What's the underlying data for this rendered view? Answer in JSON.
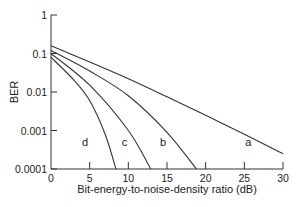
{
  "chart_data": {
    "type": "line",
    "title": "",
    "xlabel": "Bit-energy-to-noise-density ratio (dB)",
    "ylabel": "BER",
    "xlim": [
      0,
      30
    ],
    "ylim": [
      0.0001,
      1
    ],
    "yscale": "log",
    "grid": false,
    "legend": "inline curve labels",
    "x_ticks": [
      0,
      5,
      10,
      15,
      20,
      25,
      30
    ],
    "x_tick_labels": [
      "0",
      "5",
      "10",
      "15",
      "20",
      "25",
      "30"
    ],
    "y_ticks": [
      1,
      0.1,
      0.01,
      0.001,
      0.0001
    ],
    "y_tick_labels": [
      "1",
      "0.1",
      "0.01",
      "0.001",
      "0.0001"
    ],
    "series": [
      {
        "name": "a",
        "label_pos": [
          25.5,
          0.0004
        ],
        "x": [
          0,
          5,
          10,
          15,
          20,
          25,
          30
        ],
        "values": [
          0.16,
          0.06,
          0.022,
          0.0075,
          0.0025,
          0.0008,
          0.00025
        ]
      },
      {
        "name": "b",
        "label_pos": [
          14.5,
          0.0004
        ],
        "x": [
          0,
          5,
          10,
          15,
          18.8
        ],
        "values": [
          0.12,
          0.035,
          0.008,
          0.0009,
          0.0001
        ]
      },
      {
        "name": "c",
        "label_pos": [
          9.5,
          0.0004
        ],
        "x": [
          0,
          5,
          10,
          12.9
        ],
        "values": [
          0.1,
          0.015,
          0.001,
          0.0001
        ]
      },
      {
        "name": "d",
        "label_pos": [
          4.4,
          0.0004
        ],
        "x": [
          0,
          3,
          5,
          7,
          8.4
        ],
        "values": [
          0.08,
          0.02,
          0.006,
          0.0008,
          0.0001
        ]
      }
    ]
  },
  "labels": {
    "xlabel": "Bit-energy-to-noise-density ratio (dB)",
    "ylabel": "BER"
  }
}
